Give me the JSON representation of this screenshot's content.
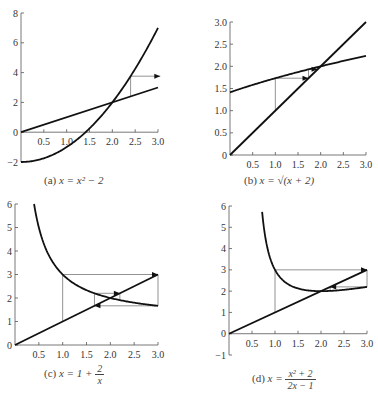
{
  "chart_data": [
    {
      "id": "a",
      "type": "line",
      "title": "(a) x = x² − 2",
      "caption_label": "(a)",
      "caption_eq": "x = x² − 2",
      "xlim": [
        0,
        3.0
      ],
      "ylim": [
        -2,
        8
      ],
      "xticks": [
        "0.5",
        "1.0",
        "1.5",
        "2.0",
        "2.5",
        "3.0"
      ],
      "yticks": [
        "−2",
        "0",
        "2",
        "4",
        "6",
        "8"
      ],
      "series": [
        {
          "name": "y = x² − 2",
          "x": [
            0,
            0.5,
            1.0,
            1.5,
            2.0,
            2.5,
            3.0
          ],
          "y": [
            -2,
            -1.75,
            -1,
            0.25,
            2,
            4.25,
            7
          ]
        },
        {
          "name": "y = x",
          "x": [
            0,
            3.0
          ],
          "y": [
            0,
            3.0
          ]
        }
      ],
      "cobweb": [
        [
          2.4,
          2.4
        ],
        [
          2.4,
          3.76
        ],
        [
          3.05,
          3.76
        ]
      ],
      "fixed_point": [
        2,
        2
      ],
      "grid": false
    },
    {
      "id": "b",
      "type": "line",
      "title": "(b) x = √(x + 2)",
      "caption_label": "(b)",
      "caption_eq": "x = √(x + 2)",
      "xlim": [
        0,
        3.0
      ],
      "ylim": [
        0,
        3.0
      ],
      "xticks": [
        "0.5",
        "1.0",
        "1.5",
        "2.0",
        "2.5",
        "3.0"
      ],
      "yticks": [
        "0",
        "0.5",
        "1.0",
        "1.5",
        "2.0",
        "2.5",
        "3.0"
      ],
      "series": [
        {
          "name": "y = √(x + 2)",
          "x": [
            0,
            0.5,
            1.0,
            1.5,
            2.0,
            2.5,
            3.0
          ],
          "y": [
            1.414,
            1.581,
            1.732,
            1.871,
            2.0,
            2.121,
            2.236
          ]
        },
        {
          "name": "y = x",
          "x": [
            0,
            3.0
          ],
          "y": [
            0,
            3.0
          ]
        }
      ],
      "cobweb": [
        [
          1.0,
          1.0
        ],
        [
          1.0,
          1.732
        ],
        [
          1.732,
          1.732
        ],
        [
          1.732,
          1.932
        ],
        [
          1.932,
          1.932
        ]
      ],
      "fixed_point": [
        2,
        2
      ],
      "grid": false
    },
    {
      "id": "c",
      "type": "line",
      "title": "(c) x = 1 + 2/x",
      "caption_label": "(c)",
      "caption_eq_left": "x = 1 +",
      "caption_num": "2",
      "caption_den": "x",
      "xlim": [
        0,
        3.0
      ],
      "ylim": [
        0,
        6
      ],
      "xticks": [
        "0.5",
        "1.0",
        "1.5",
        "2.0",
        "2.5",
        "3.0"
      ],
      "yticks": [
        "0",
        "1",
        "2",
        "3",
        "4",
        "5",
        "6"
      ],
      "series": [
        {
          "name": "y = 1 + 2/x",
          "x": [
            0.4,
            0.5,
            0.75,
            1.0,
            1.5,
            2.0,
            2.5,
            3.0
          ],
          "y": [
            6,
            5,
            3.667,
            3,
            2.333,
            2,
            1.8,
            1.667
          ]
        },
        {
          "name": "y = x",
          "x": [
            0,
            3.0
          ],
          "y": [
            0,
            3.0
          ]
        }
      ],
      "cobweb": [
        [
          1.0,
          1.0
        ],
        [
          1.0,
          3.0
        ],
        [
          3.0,
          3.0
        ],
        [
          3.0,
          1.667
        ],
        [
          1.667,
          1.667
        ],
        [
          1.667,
          2.2
        ],
        [
          2.2,
          2.2
        ],
        [
          2.2,
          1.909
        ]
      ],
      "fixed_point": [
        2,
        2
      ],
      "grid": false
    },
    {
      "id": "d",
      "type": "line",
      "title": "(d) x = (x² + 2)/(2x − 1)",
      "caption_label": "(d)",
      "caption_eq_left": "x =",
      "caption_num": "x² + 2",
      "caption_den": "2x − 1",
      "xlim": [
        0,
        3.0
      ],
      "ylim": [
        -1,
        6
      ],
      "xticks": [
        "0.5",
        "1.0",
        "1.5",
        "2.0",
        "2.5",
        "3.0"
      ],
      "yticks": [
        "−1",
        "0",
        "1",
        "2",
        "3",
        "4",
        "5",
        "6"
      ],
      "series": [
        {
          "name": "y = (x² + 2)/(2x − 1)",
          "x": [
            0.72,
            0.8,
            1.0,
            1.25,
            1.5,
            2.0,
            2.5,
            3.0
          ],
          "y": [
            6.0,
            4.4,
            3.0,
            2.417,
            2.125,
            2.0,
            2.063,
            2.2
          ]
        },
        {
          "name": "y = x",
          "x": [
            0,
            3.0
          ],
          "y": [
            0,
            3.0
          ]
        }
      ],
      "cobweb": [
        [
          1.0,
          1.0
        ],
        [
          1.0,
          3.0
        ],
        [
          3.0,
          3.0
        ],
        [
          3.0,
          2.2
        ],
        [
          2.2,
          2.2
        ],
        [
          2.2,
          2.009
        ]
      ],
      "fixed_point": [
        2,
        2
      ],
      "grid": false
    }
  ]
}
